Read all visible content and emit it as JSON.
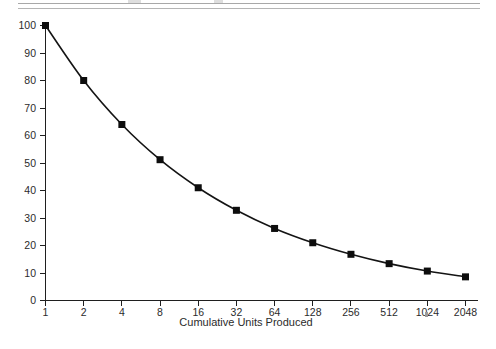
{
  "page": {
    "background_color": "#ffffff",
    "rule_color": "#a8a8a8",
    "top_rule_label": "page-rule-top",
    "bottom_rule_label": "page-rule-bottom"
  },
  "chart_data": {
    "type": "line",
    "title": "",
    "subtitle": "",
    "xlabel": "Cumulative Units Produced",
    "ylabel": "",
    "categories": [
      "1",
      "2",
      "4",
      "8",
      "16",
      "32",
      "64",
      "128",
      "256",
      "512",
      "1024",
      "2048"
    ],
    "x": [
      1,
      2,
      4,
      8,
      16,
      32,
      64,
      128,
      256,
      512,
      1024,
      2048
    ],
    "values": [
      100,
      80,
      64,
      51.2,
      41,
      32.8,
      26.2,
      21,
      16.8,
      13.4,
      10.7,
      8.6
    ],
    "series": [
      {
        "name": "80% Learning Curve",
        "values": [
          100,
          80,
          64,
          51.2,
          41,
          32.8,
          26.2,
          21,
          16.8,
          13.4,
          10.7,
          8.6
        ]
      }
    ],
    "xlim": [
      1,
      2048
    ],
    "ylim": [
      0,
      100
    ],
    "x_scale": "log2",
    "y_ticks": [
      0,
      10,
      20,
      30,
      40,
      50,
      60,
      70,
      80,
      90,
      100
    ],
    "y_tick_labels": [
      "0",
      "10",
      "20",
      "30",
      "40",
      "50",
      "60",
      "70",
      "80",
      "90",
      "100"
    ],
    "x_tick_labels": [
      "1",
      "2",
      "4",
      "8",
      "16",
      "32",
      "64",
      "128",
      "256",
      "512",
      "1024",
      "2048"
    ],
    "grid": false,
    "legend": false,
    "legend_position": "none",
    "marker": "square",
    "marker_color": "#0d0d0d",
    "line_color": "#141414",
    "annotations": []
  }
}
